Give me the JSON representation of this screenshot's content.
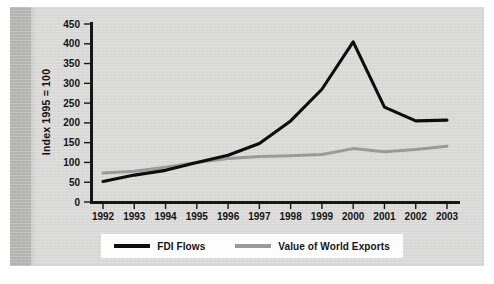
{
  "chart_data": {
    "type": "line",
    "title": "",
    "subtitle": "",
    "xlabel": "",
    "ylabel": "Index 1995 = 100",
    "x": [
      1992,
      1993,
      1994,
      1995,
      1996,
      1997,
      1998,
      1999,
      2000,
      2001,
      2002,
      2003
    ],
    "categories": [
      "1992",
      "1993",
      "1994",
      "1995",
      "1996",
      "1997",
      "1998",
      "1999",
      "2000",
      "2001",
      "2002",
      "2003"
    ],
    "series": [
      {
        "name": "FDI Flows",
        "color": "#0d0d0d",
        "values": [
          52,
          68,
          80,
          100,
          118,
          148,
          205,
          285,
          405,
          240,
          205,
          207
        ]
      },
      {
        "name": "Value of World Exports",
        "color": "#9a9a98",
        "values": [
          73,
          78,
          88,
          100,
          110,
          115,
          117,
          120,
          135,
          127,
          133,
          141
        ]
      }
    ],
    "ylim": [
      0,
      450
    ],
    "yticks": [
      0,
      50,
      100,
      150,
      200,
      250,
      300,
      350,
      400,
      450
    ],
    "ytick_labels": [
      "0",
      "50",
      "100",
      "150",
      "200",
      "250",
      "300",
      "350",
      "400",
      "450"
    ],
    "xlim": [
      1992,
      2003
    ],
    "grid": false,
    "legend_position": "bottom",
    "legend_entries": [
      "FDI Flows",
      "Value of World Exports"
    ]
  },
  "legend": {
    "fdi_label": "FDI Flows",
    "exports_label": "Value of World Exports"
  },
  "colors": {
    "page_background": "#d9d9d7",
    "spine_band": "#b4b4b2",
    "axis": "#161616",
    "fdi_line": "#0d0d0d",
    "exports_line": "#9a9a98",
    "legend_background": "#fdfdfd",
    "text": "#141414"
  }
}
